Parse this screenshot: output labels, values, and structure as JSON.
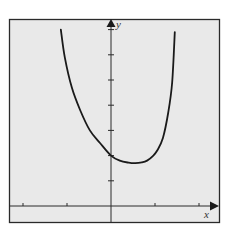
{
  "chart_data": {
    "type": "line",
    "title": "",
    "xlabel": "x",
    "ylabel": "y",
    "xlim": [
      -2.2,
      2.5
    ],
    "ylim": [
      -0.6,
      7.5
    ],
    "grid": false,
    "legend": null,
    "x_ticks": [
      -2,
      -1,
      1,
      2
    ],
    "y_ticks": [
      1,
      2,
      3,
      4,
      5,
      6,
      7
    ],
    "tick_labels_shown": false,
    "series": [
      {
        "name": "curve",
        "color": "#1a1a1a",
        "x": [
          -1.14,
          -1.05,
          -0.89,
          -0.7,
          -0.48,
          -0.25,
          0.0,
          0.2,
          0.4,
          0.55,
          0.7,
          0.82,
          0.95,
          1.05,
          1.18,
          1.3,
          1.39,
          1.45
        ],
        "y": [
          7.0,
          5.9,
          4.7,
          3.8,
          3.0,
          2.5,
          2.0,
          1.8,
          1.72,
          1.7,
          1.73,
          1.8,
          1.98,
          2.2,
          2.7,
          3.7,
          4.9,
          6.9
        ]
      }
    ],
    "annotations": [
      {
        "text": "y",
        "position": "top of y-axis"
      },
      {
        "text": "x",
        "position": "right end of x-axis"
      }
    ]
  },
  "style": {
    "background": "#e9e9e9",
    "frame_color": "#2a2a2a",
    "axis_color": "#2a2a2a",
    "curve_color": "#1a1a1a"
  },
  "labels": {
    "x_axis": "x",
    "y_axis": "y"
  }
}
